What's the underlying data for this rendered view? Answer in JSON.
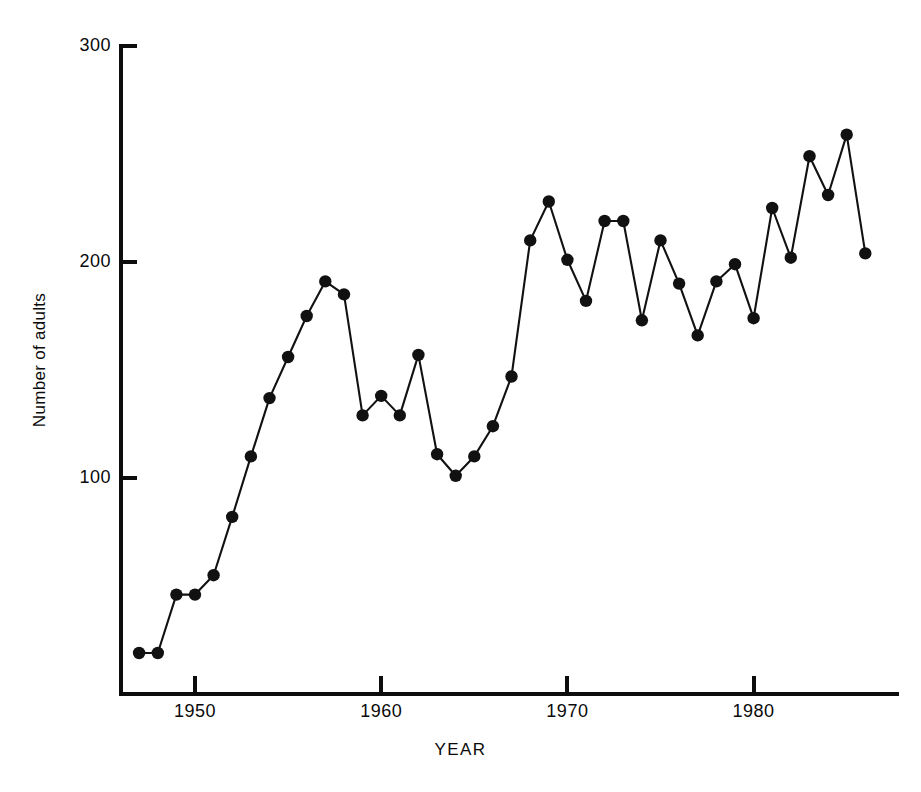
{
  "chart_data": {
    "type": "line",
    "title": "",
    "xlabel": "YEAR",
    "ylabel": "Number of adults",
    "xlim": [
      1946,
      1987
    ],
    "ylim": [
      0,
      300
    ],
    "grid": false,
    "legend": "none",
    "marker": "filled-circle",
    "line_color": "#111111",
    "marker_color": "#111111",
    "background_color": "#ffffff",
    "xticks": [
      1950,
      1960,
      1970,
      1980
    ],
    "xtick_labels": [
      "1950",
      "1960",
      "1970",
      "1980"
    ],
    "yticks": [
      100,
      200,
      300
    ],
    "ytick_labels": [
      "100",
      "200",
      "300"
    ],
    "x": [
      1947,
      1948,
      1949,
      1950,
      1951,
      1952,
      1953,
      1954,
      1955,
      1956,
      1957,
      1958,
      1959,
      1960,
      1961,
      1962,
      1963,
      1964,
      1965,
      1966,
      1967,
      1968,
      1969,
      1970,
      1971,
      1972,
      1973,
      1974,
      1975,
      1976,
      1977,
      1978,
      1979,
      1980,
      1981,
      1982,
      1983,
      1984,
      1985,
      1986
    ],
    "values": [
      19,
      19,
      46,
      46,
      55,
      82,
      110,
      137,
      156,
      175,
      191,
      185,
      129,
      138,
      129,
      157,
      111,
      101,
      110,
      124,
      147,
      210,
      228,
      201,
      182,
      219,
      219,
      173,
      210,
      190,
      166,
      191,
      199,
      174,
      225,
      202,
      249,
      231,
      259,
      204
    ]
  },
  "axes": {
    "y_axis_label": "Number of adults",
    "x_axis_label": "YEAR"
  }
}
